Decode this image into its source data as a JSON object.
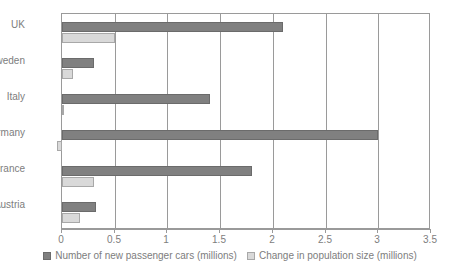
{
  "chart_data": {
    "type": "bar",
    "orientation": "horizontal",
    "title": "",
    "xlabel": "",
    "ylabel": "",
    "xlim": [
      0,
      3.5
    ],
    "xticks": [
      "0",
      "0.5",
      "1",
      "1.5",
      "2",
      "2.5",
      "3",
      "3.5"
    ],
    "xtick_values": [
      0,
      0.5,
      1,
      1.5,
      2,
      2.5,
      3,
      3.5
    ],
    "grid": true,
    "grid_axis": "x",
    "legend_position": "bottom",
    "categories": [
      "UK",
      "Sweden",
      "Italy",
      "Germany",
      "France",
      "Austria"
    ],
    "series": [
      {
        "name": "Number of new passenger cars (millions)",
        "color": "#808080",
        "values": [
          2.1,
          0.3,
          1.4,
          3.0,
          1.8,
          0.32
        ]
      },
      {
        "name": "Change in population size (millions)",
        "color": "#d9d9d9",
        "values": [
          0.5,
          0.1,
          0.01,
          -0.05,
          0.3,
          0.17
        ]
      }
    ]
  },
  "axis": {
    "tick_labels": [
      "0",
      "0.5",
      "1",
      "1.5",
      "2",
      "2.5",
      "3",
      "3.5"
    ]
  },
  "categories": [
    {
      "label": "UK"
    },
    {
      "label": "Sweden"
    },
    {
      "label": "Italy"
    },
    {
      "label": "Germany"
    },
    {
      "label": "France"
    },
    {
      "label": "Austria"
    }
  ],
  "legend": {
    "items": [
      {
        "label": "Number of new passenger cars (millions)",
        "swatch": "dark-gray-swatch"
      },
      {
        "label": "Change in population size (millions)",
        "swatch": "light-gray-swatch"
      }
    ]
  }
}
